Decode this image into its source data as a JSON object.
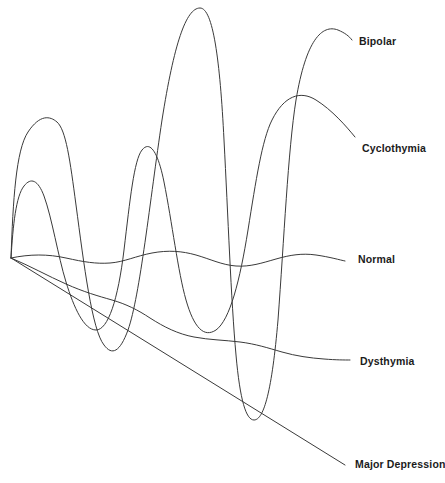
{
  "figure": {
    "background_color": "#ffffff",
    "stroke_color": "#3a3a3a",
    "label_color": "#1b1b1b",
    "width": 445,
    "height": 483,
    "origin": {
      "x": 11,
      "y": 258
    }
  },
  "labels": {
    "bipolar": "Bipolar",
    "cyclothymia": "Cyclothymia",
    "normal": "Normal",
    "dysthymia": "Dysthymia",
    "major_depression": "Major Depression"
  },
  "chart_data": {
    "type": "line",
    "title": "",
    "subtitle": "",
    "xlabel": "",
    "ylabel": "",
    "grid": false,
    "legend_position": "right-inline-endpoint-labels",
    "axis_note": "Unlabeled axes: horizontal axis represents time, vertical axis represents mood level. All five mood trajectories radiate from a single shared origin point at the left.",
    "xlim": [
      0,
      445
    ],
    "ylim": [
      483,
      0
    ],
    "series": [
      {
        "name": "Bipolar",
        "label_endpoint": {
          "x": 352,
          "y": 40
        },
        "description": "Extreme high-amplitude oscillation swinging from highest manic peaks to deepest depressive troughs.",
        "path": "M11,258 C13,200 16,150 28,132 C40,114 50,116 57,122 C66,130 70,160 76,205 C84,265 92,330 104,345 C112,356 120,352 128,330 C140,296 150,200 162,120 C174,44 186,8 200,8 C213,8 220,60 224,140 C228,215 231,300 236,355 C240,400 246,420 254,420 C264,420 272,390 278,320 C284,240 288,150 296,100 C306,40 322,24 338,30 C345,33 349,36 352,40",
        "extrema": [
          {
            "type": "peak",
            "x": 57,
            "y": 119
          },
          {
            "type": "trough",
            "x": 112,
            "y": 350
          },
          {
            "type": "peak",
            "x": 200,
            "y": 8
          },
          {
            "type": "trough",
            "x": 254,
            "y": 420
          },
          {
            "type": "end",
            "x": 352,
            "y": 40
          }
        ]
      },
      {
        "name": "Cyclothymia",
        "label_endpoint": {
          "x": 355,
          "y": 137
        },
        "description": "Moderate-amplitude cyclic mood swings, milder than bipolar but clearly above and below the normal band.",
        "path": "M11,258 C13,225 16,196 24,186 C31,177 38,180 44,196 C52,218 58,256 66,282 C74,308 84,330 96,330 C108,330 118,300 124,250 C130,200 134,160 142,150 C150,140 158,152 164,182 C172,222 178,272 186,300 C194,328 204,338 216,330 C230,320 240,280 248,230 C256,180 262,140 272,120 C284,96 300,90 316,100 C332,110 346,126 355,137",
        "extrema": [
          {
            "type": "peak",
            "x": 30,
            "y": 181
          },
          {
            "type": "trough",
            "x": 96,
            "y": 331
          },
          {
            "type": "peak",
            "x": 148,
            "y": 148
          },
          {
            "type": "trough",
            "x": 212,
            "y": 333
          },
          {
            "type": "peak",
            "x": 290,
            "y": 94
          },
          {
            "type": "end",
            "x": 355,
            "y": 137
          }
        ]
      },
      {
        "name": "Normal",
        "label_endpoint": {
          "x": 345,
          "y": 261
        },
        "description": "Near-flat baseline with very small gentle undulations; the euthymic reference band.",
        "path": "M11,258 C30,254 48,254 66,258 C84,262 96,264 110,263 C124,262 136,256 152,253 C168,250 182,251 196,255 C210,259 222,265 236,266 C250,267 262,263 276,259 C290,255 302,253 316,255 C330,257 340,260 345,261",
        "extrema": [
          {
            "type": "trough",
            "x": 66,
            "y": 259
          },
          {
            "type": "peak",
            "x": 158,
            "y": 252
          },
          {
            "type": "trough",
            "x": 238,
            "y": 266
          },
          {
            "type": "peak",
            "x": 300,
            "y": 254
          },
          {
            "type": "end",
            "x": 345,
            "y": 261
          }
        ]
      },
      {
        "name": "Dysthymia",
        "label_endpoint": {
          "x": 350,
          "y": 360
        },
        "description": "Chronic low-grade depressed mood: gradual decline with small waves, staying persistently below the normal line.",
        "path": "M11,258 C30,266 48,276 66,284 C84,292 98,296 112,300 C126,304 138,310 150,318 C164,327 178,334 194,337 C210,340 224,340 240,342 C256,344 268,348 282,352 C296,356 310,358 324,359 C336,360 345,360 350,360",
        "extrema": [
          {
            "type": "inflection",
            "x": 112,
            "y": 300
          },
          {
            "type": "inflection",
            "x": 196,
            "y": 337
          },
          {
            "type": "inflection",
            "x": 284,
            "y": 353
          },
          {
            "type": "end",
            "x": 350,
            "y": 360
          }
        ]
      },
      {
        "name": "Major Depression",
        "label_endpoint": {
          "x": 345,
          "y": 465
        },
        "description": "Steady steep straight-line descent to the deepest sustained low mood.",
        "path": "M11,258 L345,465",
        "extrema": [
          {
            "type": "start",
            "x": 11,
            "y": 258
          },
          {
            "type": "end",
            "x": 345,
            "y": 465
          }
        ]
      }
    ]
  }
}
